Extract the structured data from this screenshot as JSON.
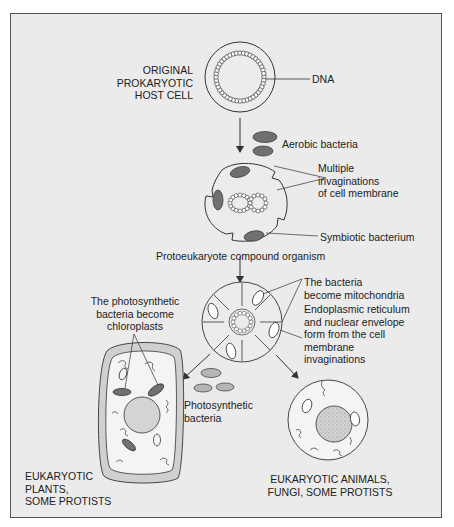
{
  "diagram": {
    "labels": {
      "host_cell": "ORIGINAL\nPROKARYOTIC\nHOST CELL",
      "dna": "DNA",
      "aerobic_bacteria": "Aerobic bacteria",
      "invaginations": "Multiple\ninvaginations\nof cell membrane",
      "symbiotic_bacterium": "Symbiotic bacterium",
      "protoeukaryote": "Protoeukaryote compound organism",
      "mitochondria": "The bacteria\nbecome mitochondria",
      "er_nuclear": "Endoplasmic reticulum\nand nuclear envelope\nform from the cell\nmembrane\ninvaginations",
      "chloroplasts": "The photosynthetic\nbacteria become\nchloroplasts",
      "photosynthetic_bacteria": "Photosynthetic\nbacteria",
      "plants": "EUKARYOTIC\nPLANTS,\nSOME PROTISTS",
      "animals": "EUKARYOTIC ANIMALS,\nFUNGI, SOME PROTISTS"
    },
    "nodes": [
      {
        "id": "host_cell",
        "label": "Original prokaryotic host cell"
      },
      {
        "id": "protoeukaryote",
        "label": "Protoeukaryote compound organism"
      },
      {
        "id": "early_eukaryote",
        "label": "Cell with mitochondria and nuclear envelope"
      },
      {
        "id": "plant_cell",
        "label": "Eukaryotic plants, some protists"
      },
      {
        "id": "animal_cell",
        "label": "Eukaryotic animals, fungi, some protists"
      }
    ],
    "edges": [
      {
        "from": "host_cell",
        "to": "protoeukaryote",
        "via": "Aerobic bacteria"
      },
      {
        "from": "protoeukaryote",
        "to": "early_eukaryote"
      },
      {
        "from": "early_eukaryote",
        "to": "plant_cell",
        "via": "Photosynthetic bacteria"
      },
      {
        "from": "early_eukaryote",
        "to": "animal_cell"
      }
    ],
    "colors": {
      "background": "#ebebeb",
      "frame": "#555555",
      "line": "#333333",
      "bacteria_dark": "#707070",
      "bacteria_light": "#b5b5b5",
      "wall": "#d0d0d0",
      "nucleus": "#cfcfcf"
    }
  }
}
